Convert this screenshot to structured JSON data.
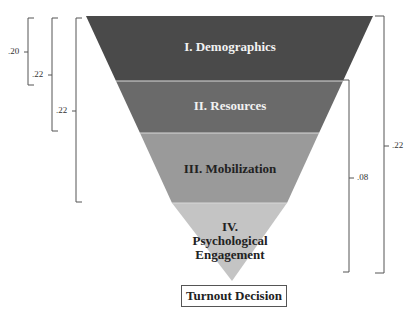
{
  "diagram": {
    "type": "inverted-funnel",
    "stages": [
      {
        "label": "I. Demographics",
        "color": "#4a4a4a"
      },
      {
        "label": "II. Resources",
        "color": "#6a6a6a"
      },
      {
        "label": "III. Mobilization",
        "color": "#9a9a9a"
      },
      {
        "label_line1": "IV.",
        "label_line2": "Psychological",
        "label_line3": "Engagement",
        "color": "#c4c4c4"
      }
    ],
    "outcome": "Turnout Decision",
    "left_brackets": [
      {
        "value": ".20",
        "spans": "I"
      },
      {
        "value": ".22",
        "spans": "I–II"
      },
      {
        "value": ".22",
        "spans": "I–III"
      }
    ],
    "right_brackets": [
      {
        "value": ".08",
        "spans": "II–IV"
      },
      {
        "value": ".22",
        "spans": "I–IV"
      }
    ]
  }
}
